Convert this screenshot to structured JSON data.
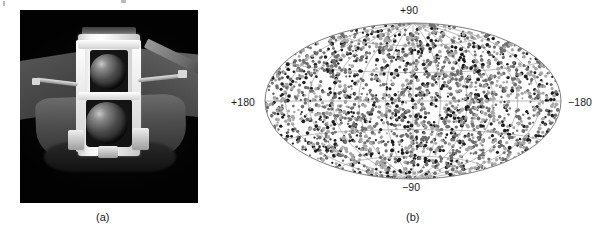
{
  "figure": {
    "kind": "two-panel scientific figure",
    "panels": [
      {
        "id": "a",
        "caption": "(a)",
        "type": "photograph",
        "subject": "gamma-ray observatory spacecraft in orbit",
        "background_color": "#050505"
      },
      {
        "id": "b",
        "caption": "(b)",
        "type": "all-sky scatter map",
        "projection": "Aitoff / Mollweide equal-area ellipse"
      }
    ]
  },
  "sky_map": {
    "labels": {
      "top": "+90",
      "bottom": "−90",
      "left": "+180",
      "right": "−180"
    },
    "grid": {
      "visible": true,
      "latitude_step_deg": 30,
      "longitude_step_deg": 30,
      "line_color": "#9a9a9a"
    },
    "marker_colors": {
      "dark": "#1e1e1e",
      "mid": "#6f6f6f",
      "light": "#a8a8a8"
    }
  },
  "chart_data": {
    "type": "scatter",
    "title": "",
    "subtitle": "",
    "xlabel": "Galactic longitude",
    "ylabel": "Galactic latitude",
    "projection": "aitoff",
    "xlim": [
      180,
      -180
    ],
    "ylim": [
      -90,
      90
    ],
    "grid": true,
    "legend": "none",
    "tick_labels": {
      "x": [
        "+180",
        "−180"
      ],
      "y": [
        "+90",
        "−90"
      ]
    },
    "annotations": [
      "(a)",
      "(b)"
    ],
    "series": [
      {
        "name": "burst events (dark)",
        "color": "#1e1e1e",
        "n_points": 620,
        "distribution": "isotropic (uniform on sphere)"
      },
      {
        "name": "burst events (mid-grey)",
        "color": "#6f6f6f",
        "n_points": 980,
        "distribution": "isotropic (uniform on sphere)"
      },
      {
        "name": "burst events (light-grey)",
        "color": "#a8a8a8",
        "n_points": 700,
        "distribution": "isotropic (uniform on sphere)"
      }
    ]
  }
}
